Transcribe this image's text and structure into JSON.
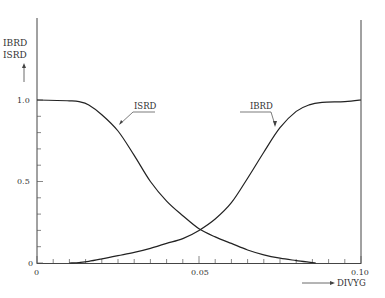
{
  "chart_data": {
    "type": "line",
    "title": "",
    "xlabel": "DIVYG",
    "ylabel": "IBRD ISRD",
    "ylabel_lines": [
      "IBRD",
      "ISRD"
    ],
    "xlim": [
      0,
      0.1
    ],
    "ylim": [
      0,
      1.0
    ],
    "x_ticks": [
      0,
      0.05,
      0.1
    ],
    "x_tick_labels": [
      "0",
      "0.05",
      "0.10"
    ],
    "x_minor_step": 0.005,
    "y_ticks": [
      0,
      0.5,
      1.0
    ],
    "y_tick_labels": [
      "0",
      "0.5",
      "1.0"
    ],
    "y_minor_step": 0.1,
    "grid": false,
    "legend": "inline curve labels",
    "series": [
      {
        "name": "ISRD",
        "x": [
          0,
          0.01,
          0.013,
          0.016,
          0.02,
          0.025,
          0.03,
          0.035,
          0.04,
          0.045,
          0.05,
          0.055,
          0.06,
          0.065,
          0.07,
          0.075,
          0.08,
          0.085,
          0.086
        ],
        "y": [
          1.0,
          0.995,
          0.99,
          0.97,
          0.91,
          0.81,
          0.66,
          0.5,
          0.38,
          0.29,
          0.21,
          0.16,
          0.12,
          0.08,
          0.05,
          0.03,
          0.015,
          0.003,
          0.0
        ]
      },
      {
        "name": "IBRD",
        "x": [
          0.01,
          0.013,
          0.016,
          0.02,
          0.025,
          0.03,
          0.035,
          0.04,
          0.045,
          0.05,
          0.055,
          0.06,
          0.065,
          0.07,
          0.075,
          0.08,
          0.084,
          0.088,
          0.095,
          0.1
        ],
        "y": [
          0.0,
          0.003,
          0.01,
          0.025,
          0.045,
          0.065,
          0.09,
          0.12,
          0.15,
          0.2,
          0.27,
          0.37,
          0.52,
          0.68,
          0.83,
          0.93,
          0.97,
          0.985,
          0.99,
          1.0
        ]
      }
    ],
    "annotations": [
      {
        "text": "ISRD",
        "target_series": "ISRD",
        "x": 0.027,
        "y": 0.86
      },
      {
        "text": "IBRD",
        "target_series": "IBRD",
        "x": 0.074,
        "y": 0.84
      }
    ]
  },
  "labels": {
    "y_axis_top": "IBRD",
    "y_axis_bottom": "ISRD",
    "x_axis": "DIVYG",
    "isrd_curve": "ISRD",
    "ibrd_curve": "IBRD",
    "x_tick_0": "0",
    "x_tick_mid": "0.05",
    "x_tick_end": "0.10",
    "y_tick_0": "0",
    "y_tick_mid": "0.5",
    "y_tick_top": "1.0"
  }
}
